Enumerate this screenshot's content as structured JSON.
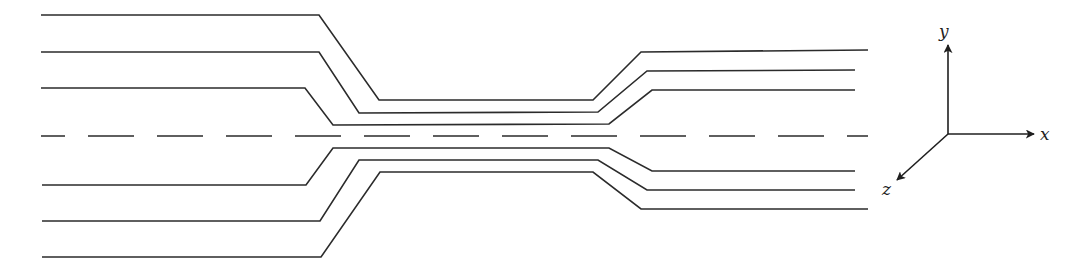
{
  "figure": {
    "stroke_color": "#2b2b2b",
    "background": "#ffffff"
  },
  "streamlines": {
    "upper": [
      {
        "id": "upper-outer",
        "points": [
          [
            41,
            15
          ],
          [
            319,
            15
          ],
          [
            379,
            100
          ],
          [
            593,
            100
          ],
          [
            641,
            52
          ],
          [
            868,
            50
          ]
        ]
      },
      {
        "id": "upper-middle",
        "points": [
          [
            41,
            52
          ],
          [
            319,
            52
          ],
          [
            359,
            113
          ],
          [
            598,
            112
          ],
          [
            647,
            71
          ],
          [
            855,
            70
          ]
        ]
      },
      {
        "id": "upper-inner",
        "points": [
          [
            41,
            88
          ],
          [
            305,
            88
          ],
          [
            333,
            125
          ],
          [
            609,
            124
          ],
          [
            652,
            90
          ],
          [
            855,
            90
          ]
        ]
      }
    ],
    "lower": [
      {
        "id": "lower-inner",
        "points": [
          [
            42,
            185
          ],
          [
            306,
            185
          ],
          [
            333,
            148
          ],
          [
            609,
            148
          ],
          [
            652,
            171
          ],
          [
            855,
            171
          ]
        ]
      },
      {
        "id": "lower-middle",
        "points": [
          [
            42,
            221
          ],
          [
            320,
            221
          ],
          [
            359,
            160
          ],
          [
            598,
            160
          ],
          [
            647,
            190
          ],
          [
            855,
            190
          ]
        ]
      },
      {
        "id": "lower-outer",
        "points": [
          [
            42,
            257
          ],
          [
            321,
            257
          ],
          [
            380,
            172
          ],
          [
            593,
            172
          ],
          [
            641,
            209
          ],
          [
            868,
            209
          ]
        ]
      }
    ]
  },
  "centerline": {
    "style": "dashed",
    "y": 136,
    "x_start": 41,
    "x_end": 868,
    "dash": 46,
    "gap": 23,
    "first_dash": 24
  },
  "axes": {
    "origin": [
      948,
      134
    ],
    "x": {
      "label": "x",
      "tip": [
        1034,
        134
      ],
      "label_pos": [
        1040,
        140
      ]
    },
    "y": {
      "label": "y",
      "tip": [
        948,
        45
      ],
      "label_pos": [
        939,
        37
      ]
    },
    "z": {
      "label": "z",
      "tip": [
        897,
        180
      ],
      "label_pos": [
        882,
        195
      ]
    }
  }
}
